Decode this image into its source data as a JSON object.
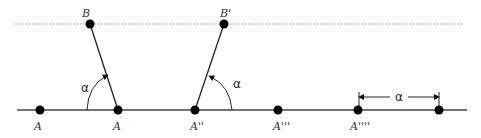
{
  "diagram": {
    "baseline": {
      "x1": 17,
      "x2": 467,
      "y": 110
    },
    "guide_line": {
      "x1": 14,
      "x2": 463,
      "y": 24,
      "style": "dotted"
    },
    "points": [
      {
        "id": "A",
        "label": "A",
        "x": 40,
        "y": 110
      },
      {
        "id": "A1",
        "label": "A'",
        "x": 118,
        "y": 110
      },
      {
        "id": "A2",
        "label": "A''",
        "x": 195,
        "y": 110
      },
      {
        "id": "A3",
        "label": "A'''",
        "x": 278,
        "y": 110
      },
      {
        "id": "A4",
        "label": "A''''",
        "x": 358,
        "y": 110
      },
      {
        "id": "A5",
        "label": "",
        "x": 439,
        "y": 110
      },
      {
        "id": "B",
        "label": "B",
        "x": 90,
        "y": 24
      },
      {
        "id": "B1",
        "label": "B'",
        "x": 224,
        "y": 24
      }
    ],
    "segments": [
      {
        "from": "A1",
        "to": "B"
      },
      {
        "from": "A2",
        "to": "B1"
      }
    ],
    "angles": [
      {
        "label": "α",
        "vertex": "A1"
      },
      {
        "label": "α",
        "vertex": "A2"
      }
    ],
    "dimension": {
      "label": "α",
      "from": "A4",
      "to": "A5"
    }
  },
  "labels": {
    "A": "A",
    "A1": "A",
    "A2": "A''",
    "A3": "A'''",
    "A4": "A''''",
    "B": "B",
    "B1": "B'",
    "angle1": "α",
    "angle2": "α",
    "dim": "α"
  },
  "colors": {
    "line": "#333333",
    "point": "#000000",
    "dotted": "#999999"
  }
}
